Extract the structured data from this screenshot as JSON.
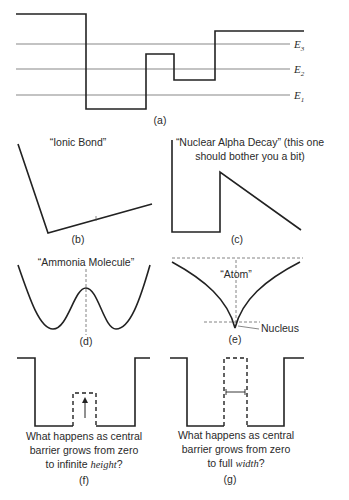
{
  "panels": {
    "a": {
      "caption": "(a)",
      "levels": [
        {
          "symbol": "E",
          "sub": "3"
        },
        {
          "symbol": "E",
          "sub": "2"
        },
        {
          "symbol": "E",
          "sub": "1"
        }
      ]
    },
    "b": {
      "title": "“Ionic Bond”",
      "caption": "(b)"
    },
    "c": {
      "title_line1": "“Nuclear Alpha Decay” (this one",
      "title_line2": "should bother you a bit)",
      "caption": "(c)"
    },
    "d": {
      "title": "“Ammonia Molecule”",
      "caption": "(d)"
    },
    "e": {
      "title": "“Atom”",
      "pointer_label": "Nucleus",
      "caption": "(e)"
    },
    "f": {
      "line1": "What happens as central",
      "line2": "barrier grows from zero",
      "line3_pre": "to infinite ",
      "line3_em": "height",
      "line3_post": "?",
      "caption": "(f)"
    },
    "g": {
      "line1": "What happens as central",
      "line2": "barrier grows from zero",
      "line3_pre": "to full ",
      "line3_em": "width",
      "line3_post": "?",
      "caption": "(g)"
    }
  }
}
